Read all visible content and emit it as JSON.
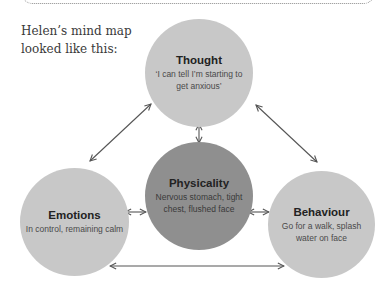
{
  "intro": {
    "line1": "Helen’s mind map",
    "line2": "looked like this:"
  },
  "nodes": {
    "thought": {
      "title": "Thought",
      "line1": "‘I can tell I’m starting to",
      "line2": "get anxious’"
    },
    "physicality": {
      "title": "Physicality",
      "line1": "Nervous stomach, tight",
      "line2": "chest, flushed face"
    },
    "emotions": {
      "title": "Emotions",
      "line1": "In control, remaining calm",
      "line2": ""
    },
    "behaviour": {
      "title": "Behaviour",
      "line1": "Go for a walk, splash",
      "line2": "water on face"
    }
  },
  "colors": {
    "node_light": "#c8c8c8",
    "node_dark": "#8f8f8f",
    "arrow": "#555555"
  },
  "connections": [
    {
      "from": "thought",
      "to": "emotions",
      "bidirectional": true
    },
    {
      "from": "thought",
      "to": "behaviour",
      "bidirectional": true
    },
    {
      "from": "thought",
      "to": "physicality",
      "bidirectional": true
    },
    {
      "from": "emotions",
      "to": "physicality",
      "bidirectional": true
    },
    {
      "from": "physicality",
      "to": "behaviour",
      "bidirectional": true
    },
    {
      "from": "emotions",
      "to": "behaviour",
      "bidirectional": true
    }
  ]
}
